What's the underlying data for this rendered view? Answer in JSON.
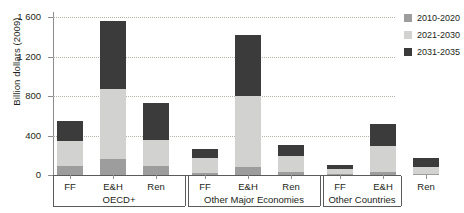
{
  "chart_data": {
    "type": "bar",
    "stacked": true,
    "title": "",
    "xlabel": "",
    "ylabel": "Billion dollars (2009)",
    "ylim": [
      0,
      1600
    ],
    "yticks": [
      0,
      400,
      800,
      1200,
      1600
    ],
    "ytick_labels": [
      "0",
      "400",
      "800",
      "1 200",
      "1 600"
    ],
    "grid": "horizontal-dotted",
    "legend_position": "right-top",
    "categories": [
      "FF",
      "E&H",
      "Ren",
      "FF",
      "E&H",
      "Ren",
      "FF",
      "E&H",
      "Ren"
    ],
    "groups": [
      {
        "label": "OECD+",
        "categories": [
          "FF",
          "E&H",
          "Ren"
        ]
      },
      {
        "label": "Other Major Economies",
        "categories": [
          "FF",
          "E&H",
          "Ren"
        ]
      },
      {
        "label": "Other Countries",
        "categories": [
          "FF",
          "E&H",
          "Ren"
        ]
      }
    ],
    "series": [
      {
        "name": "2010-2020",
        "color": "#9d9d9d",
        "values": [
          95,
          165,
          95,
          25,
          85,
          35,
          10,
          35,
          15
        ]
      },
      {
        "name": "2021-2030",
        "color": "#d2d2d0",
        "values": [
          250,
          705,
          260,
          145,
          715,
          160,
          50,
          260,
          70
        ]
      },
      {
        "name": "2031-2035",
        "color": "#3b3b3b",
        "values": [
          200,
          685,
          370,
          95,
          620,
          110,
          45,
          225,
          90
        ]
      }
    ],
    "totals": [
      545,
      1555,
      725,
      265,
      1420,
      305,
      105,
      520,
      175
    ]
  },
  "legend": {
    "items": [
      {
        "label": "2010-2020",
        "color": "#9d9d9d"
      },
      {
        "label": "2021-2030",
        "color": "#d2d2d0"
      },
      {
        "label": "2031-2035",
        "color": "#3b3b3b"
      }
    ]
  }
}
